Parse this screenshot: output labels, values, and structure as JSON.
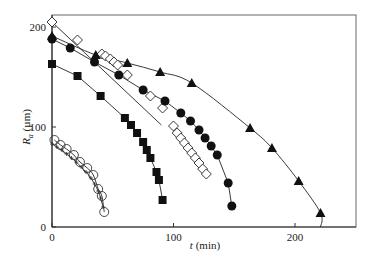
{
  "chart_data": {
    "type": "scatter",
    "title": "",
    "xlabel": "t (min)",
    "ylabel": "R_a (µm)",
    "xlim": [
      0,
      250
    ],
    "ylim": [
      0,
      210
    ],
    "xticks": [
      0,
      100,
      200
    ],
    "yticks": [
      0,
      100,
      200
    ],
    "grid": false,
    "legend": "none",
    "series": [
      {
        "name": "open-diamond",
        "marker": "diamond-open",
        "x": [
          0,
          21,
          41,
          44,
          48,
          51,
          54,
          62,
          81,
          91,
          100,
          103,
          106,
          109,
          112,
          115,
          118,
          121,
          124,
          127
        ],
        "y": [
          205,
          187,
          173,
          171,
          168,
          165,
          162,
          152,
          131,
          119,
          101,
          94,
          89,
          84,
          79,
          74,
          69,
          64,
          58,
          53
        ],
        "fit": "line",
        "fit_x": [
          0,
          90
        ],
        "fit_y": [
          205,
          102
        ]
      },
      {
        "name": "filled-triangle",
        "marker": "triangle-filled",
        "x": [
          0,
          36,
          62,
          89,
          115,
          163,
          181,
          203,
          221
        ],
        "y": [
          191,
          172,
          164,
          155,
          144,
          99,
          79,
          46,
          14
        ],
        "fit": "curve",
        "fit_end_x": 221
      },
      {
        "name": "filled-circle",
        "marker": "circle-filled",
        "x": [
          0,
          15,
          35,
          55,
          75,
          93,
          106,
          114,
          121,
          126,
          131,
          136,
          145,
          148
        ],
        "y": [
          188,
          179,
          165,
          152,
          137,
          126,
          114,
          106,
          97,
          89,
          81,
          72,
          44,
          21
        ],
        "fit": "connect"
      },
      {
        "name": "filled-square",
        "marker": "square-filled",
        "x": [
          0,
          21,
          40,
          60,
          65,
          70,
          75,
          78,
          81,
          86,
          88,
          91
        ],
        "y": [
          163,
          151,
          131,
          109,
          102,
          94,
          85,
          77,
          69,
          55,
          47,
          27
        ],
        "fit": "connect"
      },
      {
        "name": "open-circle",
        "marker": "circle-open",
        "x": [
          2,
          7,
          12,
          18,
          23,
          29,
          34,
          38,
          41,
          43
        ],
        "y": [
          87,
          82,
          78,
          72,
          65,
          59,
          52,
          38,
          31,
          15
        ],
        "fit": "curve"
      },
      {
        "name": "cross",
        "marker": "cross",
        "x": [
          0,
          4,
          8,
          12,
          16,
          20,
          24,
          28,
          32,
          35,
          38,
          40,
          42
        ],
        "y": [
          83,
          80,
          77,
          73,
          69,
          65,
          60,
          55,
          49,
          43,
          36,
          29,
          20
        ],
        "fit": "curve"
      }
    ]
  }
}
